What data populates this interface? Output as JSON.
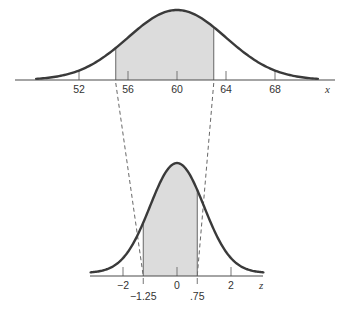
{
  "colors": {
    "curve": "#3a3a3a",
    "axis": "#4a4a4a",
    "shade": "#dcdcdc",
    "dash": "#555555",
    "text": "#333333"
  },
  "top_plot": {
    "variable": "x",
    "mean": 60,
    "sd": 4,
    "tick_labels": [
      "52",
      "56",
      "60",
      "64",
      "68"
    ],
    "tick_values": [
      52,
      56,
      60,
      64,
      68
    ],
    "shade_from": 55,
    "shade_to": 63,
    "domain": [
      48.5,
      71.5
    ]
  },
  "bottom_plot": {
    "variable": "z",
    "mean": 0,
    "sd": 1,
    "tick_labels": [
      "−2",
      "0",
      "2"
    ],
    "tick_values": [
      -2,
      0,
      2
    ],
    "marker_labels": [
      "−1.25",
      ".75"
    ],
    "marker_values": [
      -1.25,
      0.75
    ],
    "shade_from": -1.25,
    "shade_to": 0.75,
    "domain": [
      -3.2,
      3.2
    ]
  },
  "chart_data": {
    "type": "diagram",
    "title": "",
    "series": [
      {
        "name": "X ~ N(60, 4^2)",
        "xlabel": "x",
        "ticks": [
          52,
          56,
          60,
          64,
          68
        ],
        "shaded_interval": [
          55,
          63
        ]
      },
      {
        "name": "Z ~ N(0, 1)",
        "xlabel": "z",
        "ticks": [
          -2,
          0,
          2
        ],
        "labeled_points": [
          -1.25,
          0.75
        ],
        "shaded_interval": [
          -1.25,
          0.75
        ]
      }
    ],
    "mapping_lines": [
      [
        55,
        -1.25
      ],
      [
        63,
        0.75
      ]
    ]
  }
}
